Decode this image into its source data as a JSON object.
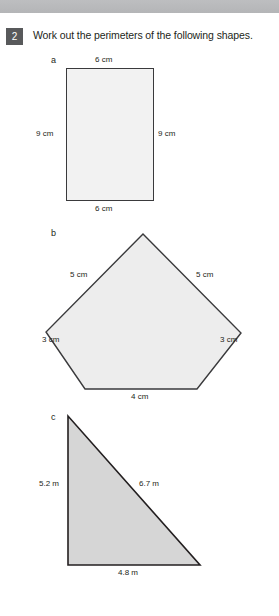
{
  "page": {
    "background_color": "#ffffff",
    "top_band_color": "#b9babc"
  },
  "question": {
    "number": "2",
    "badge_color": "#58595b",
    "text": "Work out the perimeters of the following shapes."
  },
  "parts": [
    {
      "letter": "a",
      "shape": "rectangle",
      "fill_color": "#f2f2f2",
      "stroke_color": "#3a3a3c",
      "labels": {
        "top": "6 cm",
        "left": "9 cm",
        "right": "9 cm",
        "bottom": "6 cm"
      }
    },
    {
      "letter": "b",
      "shape": "pentagon",
      "fill_color": "#ededed",
      "stroke_color": "#3a3a3c",
      "labels": {
        "upper_left": "5 cm",
        "upper_right": "5 cm",
        "lower_left": "3 cm",
        "lower_right": "3 cm",
        "bottom": "4 cm"
      }
    },
    {
      "letter": "c",
      "shape": "right-triangle",
      "fill_color": "#d6d6d6",
      "stroke_color": "#231f20",
      "labels": {
        "left": "5.2 m",
        "hypotenuse": "6.7 m",
        "bottom": "4.8 m"
      }
    }
  ]
}
